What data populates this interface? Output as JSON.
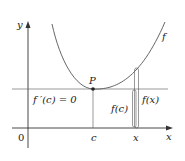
{
  "diagram": {
    "axes": {
      "x_label": "x",
      "y_label": "y",
      "origin_label": "0"
    },
    "curve_label": "f",
    "point_label": "P",
    "tick_labels": {
      "c": "c",
      "x": "x"
    },
    "annotations": {
      "derivative": "f ′(c) = 0",
      "fc": "f(c)",
      "fx": "f(x)"
    },
    "colors": {
      "line": "#333333",
      "curve": "#555555",
      "background": "#ffffff"
    }
  }
}
